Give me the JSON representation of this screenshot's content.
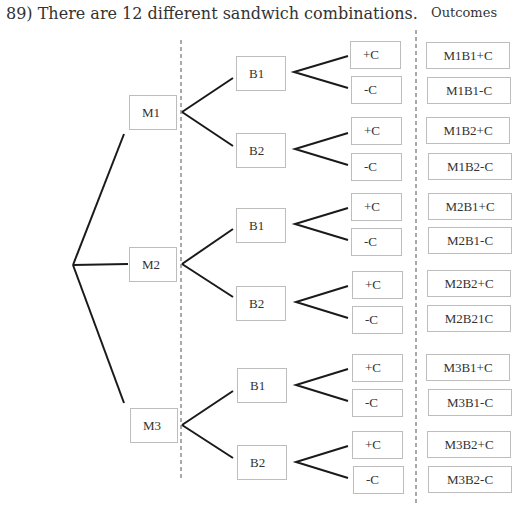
{
  "title": "89) There are 12 different sandwich combinations.",
  "outcomes_header": "Outcomes",
  "colors": {
    "line": "#1a1a1a",
    "box_border": "#bdbdbd",
    "divider": "#555555",
    "text": "#333333"
  },
  "tree": {
    "root": "start",
    "meats": [
      {
        "label": "M1",
        "breads": [
          {
            "label": "B1",
            "options": [
              "+C",
              "-C"
            ],
            "outcomes": [
              "M1B1+C",
              "M1B1-C"
            ]
          },
          {
            "label": "B2",
            "options": [
              "+C",
              "-C"
            ],
            "outcomes": [
              "M1B2+C",
              "M1B2-C"
            ]
          }
        ]
      },
      {
        "label": "M2",
        "breads": [
          {
            "label": "B1",
            "options": [
              "+C",
              "-C"
            ],
            "outcomes": [
              "M2B1+C",
              "M2B1-C"
            ]
          },
          {
            "label": "B2",
            "options": [
              "+C",
              "-C"
            ],
            "outcomes": [
              "M2B2+C",
              "M2B21C"
            ]
          }
        ]
      },
      {
        "label": "M3",
        "breads": [
          {
            "label": "B1",
            "options": [
              "+C",
              "-C"
            ],
            "outcomes": [
              "M3B1+C",
              "M3B1-C"
            ]
          },
          {
            "label": "B2",
            "options": [
              "+C",
              "-C"
            ],
            "outcomes": [
              "M3B2+C",
              "M3B2-C"
            ]
          }
        ]
      }
    ]
  }
}
